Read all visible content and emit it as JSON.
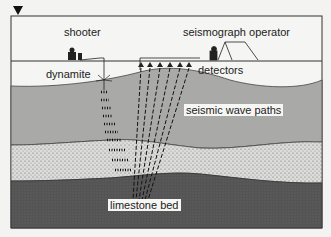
{
  "diagram": {
    "title_marker": "down-triangle",
    "labels": {
      "shooter": "shooter",
      "seismograph_operator": "seismograph operator",
      "dynamite": "dynamite",
      "detectors": "detectors",
      "seismic_wave_paths": "seismic wave paths",
      "limestone_bed": "limestone bed"
    },
    "layers": [
      {
        "name": "surface soil",
        "color": "#f5f5f3"
      },
      {
        "name": "middle stratum",
        "color": "#a9a9a7"
      },
      {
        "name": "sandstone stratum",
        "color": "#d8d8d6"
      },
      {
        "name": "limestone bed",
        "color": "#555555"
      }
    ],
    "detector_count": 6
  }
}
